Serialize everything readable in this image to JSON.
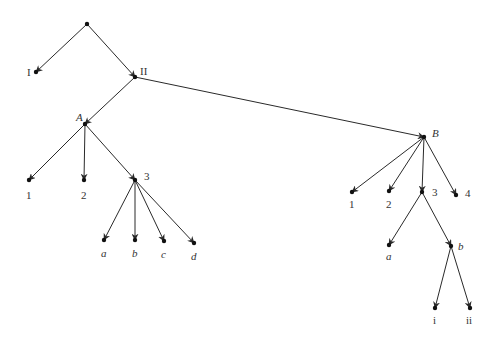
{
  "diagram": {
    "type": "tree",
    "style": {
      "edge_color": "#2a2a2a",
      "node_color": "#111111",
      "label_color": "#333333",
      "background": "#ffffff"
    },
    "nodes": [
      {
        "id": "root",
        "x": 87,
        "y": 24,
        "label": "",
        "lx": 0,
        "ly": 0,
        "italic": false
      },
      {
        "id": "I",
        "x": 36,
        "y": 72,
        "label": "I",
        "lx": 27,
        "ly": 76,
        "italic": false
      },
      {
        "id": "II",
        "x": 135,
        "y": 77,
        "label": "II",
        "lx": 140,
        "ly": 75,
        "italic": false
      },
      {
        "id": "A",
        "x": 85,
        "y": 124,
        "label": "A",
        "lx": 76,
        "ly": 121,
        "italic": true
      },
      {
        "id": "A1",
        "x": 29,
        "y": 180,
        "label": "1",
        "lx": 26,
        "ly": 199,
        "italic": false
      },
      {
        "id": "A2",
        "x": 84,
        "y": 180,
        "label": "2",
        "lx": 81,
        "ly": 199,
        "italic": false
      },
      {
        "id": "A3",
        "x": 135,
        "y": 180,
        "label": "3",
        "lx": 144,
        "ly": 180,
        "italic": false
      },
      {
        "id": "Aa",
        "x": 104,
        "y": 240,
        "label": "a",
        "lx": 101,
        "ly": 257,
        "italic": true
      },
      {
        "id": "Ab",
        "x": 135,
        "y": 240,
        "label": "b",
        "lx": 132,
        "ly": 257,
        "italic": true
      },
      {
        "id": "Ac",
        "x": 164,
        "y": 241,
        "label": "c",
        "lx": 161,
        "ly": 258,
        "italic": true
      },
      {
        "id": "Ad",
        "x": 194,
        "y": 243,
        "label": "d",
        "lx": 191,
        "ly": 260,
        "italic": true
      },
      {
        "id": "B",
        "x": 424,
        "y": 137,
        "label": "B",
        "lx": 432,
        "ly": 137,
        "italic": true
      },
      {
        "id": "B1",
        "x": 352,
        "y": 192,
        "label": "1",
        "lx": 349,
        "ly": 208,
        "italic": false
      },
      {
        "id": "B2",
        "x": 389,
        "y": 191,
        "label": "2",
        "lx": 386,
        "ly": 208,
        "italic": false
      },
      {
        "id": "B3",
        "x": 422,
        "y": 192,
        "label": "3",
        "lx": 432,
        "ly": 196,
        "italic": false
      },
      {
        "id": "B4",
        "x": 456,
        "y": 195,
        "label": "4",
        "lx": 465,
        "ly": 197,
        "italic": false
      },
      {
        "id": "Ba",
        "x": 389,
        "y": 245,
        "label": "a",
        "lx": 386,
        "ly": 260,
        "italic": true
      },
      {
        "id": "Bb",
        "x": 451,
        "y": 246,
        "label": "b",
        "lx": 458,
        "ly": 250,
        "italic": true
      },
      {
        "id": "Bi",
        "x": 435,
        "y": 308,
        "label": "i",
        "lx": 433,
        "ly": 324,
        "italic": false
      },
      {
        "id": "Bii",
        "x": 470,
        "y": 308,
        "label": "ii",
        "lx": 466,
        "ly": 324,
        "italic": false
      }
    ],
    "edges": [
      [
        "root",
        "I"
      ],
      [
        "root",
        "II"
      ],
      [
        "II",
        "A"
      ],
      [
        "II",
        "B"
      ],
      [
        "A",
        "A1"
      ],
      [
        "A",
        "A2"
      ],
      [
        "A",
        "A3"
      ],
      [
        "A3",
        "Aa"
      ],
      [
        "A3",
        "Ab"
      ],
      [
        "A3",
        "Ac"
      ],
      [
        "A3",
        "Ad"
      ],
      [
        "B",
        "B1"
      ],
      [
        "B",
        "B2"
      ],
      [
        "B",
        "B3"
      ],
      [
        "B",
        "B4"
      ],
      [
        "B3",
        "Ba"
      ],
      [
        "B3",
        "Bb"
      ],
      [
        "Bb",
        "Bi"
      ],
      [
        "Bb",
        "Bii"
      ]
    ]
  }
}
